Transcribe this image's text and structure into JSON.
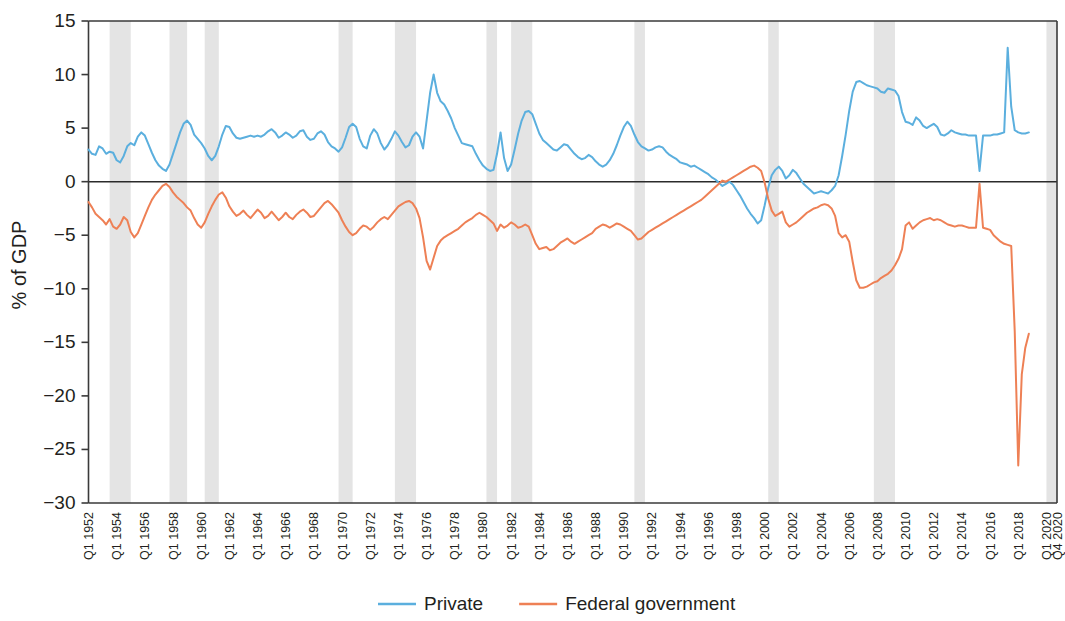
{
  "chart_data": {
    "type": "line",
    "title": "",
    "xlabel": "",
    "ylabel": "% of GDP",
    "ylim": [
      -30,
      15
    ],
    "ytick_values": [
      15,
      10,
      5,
      0,
      -5,
      -10,
      -15,
      -20,
      -25,
      -30
    ],
    "ytick_labels": [
      "15",
      "10",
      "5",
      "0",
      "−5",
      "−10",
      "−15",
      "−20",
      "−25",
      "−30"
    ],
    "grid": false,
    "zero_line": true,
    "legend_position": "bottom-center",
    "x_start_label": "Q1 1952",
    "x_end_label": "Q4 2020",
    "xtick_labels": [
      "Q1 1952",
      "Q1 1954",
      "Q1 1956",
      "Q1 1958",
      "Q1 1960",
      "Q1 1962",
      "Q1 1964",
      "Q1 1966",
      "Q1 1968",
      "Q1 1970",
      "Q1 1972",
      "Q1 1974",
      "Q1 1976",
      "Q1 1978",
      "Q1 1980",
      "Q1 1982",
      "Q1 1984",
      "Q1 1986",
      "Q1 1988",
      "Q1 1990",
      "Q1 1992",
      "Q1 1994",
      "Q1 1996",
      "Q1 1998",
      "Q1 2000",
      "Q1 2002",
      "Q1 2004",
      "Q1 2006",
      "Q1 2008",
      "Q1 2010",
      "Q1 2012",
      "Q1 2014",
      "Q1 2016",
      "Q1 2018",
      "Q1 2020",
      "Q4 2020"
    ],
    "xtick_quarter_index": [
      0,
      8,
      16,
      24,
      32,
      40,
      48,
      56,
      64,
      72,
      80,
      88,
      96,
      104,
      112,
      120,
      128,
      136,
      144,
      152,
      160,
      168,
      176,
      184,
      192,
      200,
      208,
      216,
      224,
      232,
      240,
      248,
      256,
      264,
      272,
      275
    ],
    "n_quarters": 276,
    "colors": {
      "private": "#5BAFDE",
      "federal": "#EE8055",
      "recession_band": "#d9d9d9",
      "axis": "#3a3a3a"
    },
    "series": [
      {
        "name": "Private",
        "color": "#5BAFDE",
        "values": [
          3.0,
          2.6,
          2.5,
          3.3,
          3.1,
          2.6,
          2.8,
          2.7,
          2.0,
          1.8,
          2.4,
          3.3,
          3.6,
          3.4,
          4.2,
          4.6,
          4.3,
          3.5,
          2.7,
          2.0,
          1.5,
          1.2,
          1.0,
          1.6,
          2.6,
          3.6,
          4.6,
          5.4,
          5.7,
          5.3,
          4.4,
          4.0,
          3.6,
          3.1,
          2.4,
          2.0,
          2.4,
          3.3,
          4.4,
          5.2,
          5.1,
          4.5,
          4.1,
          4.0,
          4.1,
          4.2,
          4.3,
          4.2,
          4.3,
          4.2,
          4.4,
          4.7,
          4.9,
          4.6,
          4.1,
          4.3,
          4.6,
          4.4,
          4.1,
          4.3,
          4.7,
          4.8,
          4.2,
          3.9,
          4.0,
          4.5,
          4.7,
          4.4,
          3.7,
          3.3,
          3.1,
          2.8,
          3.2,
          4.1,
          5.1,
          5.4,
          5.1,
          4.0,
          3.3,
          3.1,
          4.3,
          4.9,
          4.5,
          3.6,
          3.0,
          3.4,
          4.0,
          4.7,
          4.3,
          3.7,
          3.2,
          3.4,
          4.2,
          4.6,
          4.2,
          3.1,
          5.7,
          8.3,
          10.0,
          8.3,
          7.5,
          7.2,
          6.6,
          5.9,
          5.0,
          4.3,
          3.6,
          3.5,
          3.4,
          3.3,
          2.6,
          2.0,
          1.5,
          1.2,
          1.0,
          1.1,
          2.6,
          4.6,
          2.2,
          1.0,
          1.6,
          3.0,
          4.5,
          5.7,
          6.5,
          6.6,
          6.3,
          5.4,
          4.5,
          3.9,
          3.6,
          3.3,
          3.0,
          2.9,
          3.2,
          3.5,
          3.4,
          3.0,
          2.6,
          2.3,
          2.1,
          2.2,
          2.5,
          2.3,
          1.9,
          1.6,
          1.4,
          1.6,
          2.0,
          2.6,
          3.4,
          4.3,
          5.1,
          5.6,
          5.2,
          4.4,
          3.7,
          3.3,
          3.1,
          2.9,
          3.0,
          3.2,
          3.3,
          3.2,
          2.8,
          2.5,
          2.3,
          2.1,
          1.8,
          1.7,
          1.6,
          1.4,
          1.5,
          1.3,
          1.1,
          0.9,
          0.7,
          0.4,
          0.2,
          -0.1,
          -0.4,
          -0.2,
          0.0,
          -0.3,
          -0.8,
          -1.3,
          -1.9,
          -2.5,
          -3.0,
          -3.4,
          -3.9,
          -3.6,
          -2.2,
          -0.6,
          0.6,
          1.1,
          1.4,
          1.0,
          0.3,
          0.6,
          1.1,
          0.8,
          0.3,
          -0.2,
          -0.5,
          -0.8,
          -1.1,
          -1.0,
          -0.9,
          -1.0,
          -1.1,
          -0.8,
          -0.4,
          0.6,
          2.4,
          4.4,
          6.6,
          8.4,
          9.3,
          9.4,
          9.2,
          9.0,
          8.9,
          8.8,
          8.7,
          8.4,
          8.3,
          8.7,
          8.6,
          8.5,
          8.0,
          6.5,
          5.6,
          5.5,
          5.3,
          6.0,
          5.7,
          5.2,
          5.0,
          5.2,
          5.4,
          5.1,
          4.4,
          4.3,
          4.5,
          4.8,
          4.6,
          4.5,
          4.4,
          4.4,
          4.3,
          4.3,
          4.3,
          1.0,
          4.3,
          4.3,
          4.3,
          4.4,
          4.4,
          4.5,
          4.6,
          12.5,
          7.0,
          4.8,
          4.6,
          4.5,
          4.5,
          4.6
        ]
      },
      {
        "name": "Federal government",
        "color": "#EE8055",
        "values": [
          -1.9,
          -2.4,
          -3.0,
          -3.3,
          -3.6,
          -4.0,
          -3.5,
          -4.2,
          -4.4,
          -4.0,
          -3.3,
          -3.6,
          -4.7,
          -5.2,
          -4.8,
          -4.0,
          -3.2,
          -2.4,
          -1.7,
          -1.2,
          -0.8,
          -0.4,
          -0.2,
          -0.5,
          -1.0,
          -1.4,
          -1.7,
          -2.0,
          -2.4,
          -2.7,
          -3.4,
          -4.0,
          -4.3,
          -3.8,
          -3.0,
          -2.3,
          -1.7,
          -1.2,
          -1.0,
          -1.5,
          -2.3,
          -2.8,
          -3.2,
          -3.0,
          -2.7,
          -3.1,
          -3.4,
          -3.0,
          -2.6,
          -2.9,
          -3.4,
          -3.2,
          -2.8,
          -3.2,
          -3.6,
          -3.3,
          -2.9,
          -3.3,
          -3.5,
          -3.1,
          -2.8,
          -2.6,
          -2.9,
          -3.3,
          -3.2,
          -2.8,
          -2.4,
          -2.0,
          -1.8,
          -2.1,
          -2.5,
          -2.9,
          -3.6,
          -4.2,
          -4.7,
          -5.0,
          -4.8,
          -4.4,
          -4.1,
          -4.2,
          -4.5,
          -4.2,
          -3.8,
          -3.5,
          -3.3,
          -3.5,
          -3.1,
          -2.7,
          -2.3,
          -2.1,
          -1.9,
          -1.8,
          -2.0,
          -2.5,
          -3.4,
          -5.2,
          -7.4,
          -8.2,
          -7.1,
          -6.0,
          -5.5,
          -5.2,
          -5.0,
          -4.8,
          -4.6,
          -4.4,
          -4.1,
          -3.8,
          -3.6,
          -3.4,
          -3.1,
          -2.9,
          -3.1,
          -3.3,
          -3.6,
          -3.9,
          -4.6,
          -4.0,
          -4.3,
          -4.1,
          -3.8,
          -4.0,
          -4.3,
          -4.2,
          -4.0,
          -4.2,
          -5.0,
          -5.8,
          -6.3,
          -6.2,
          -6.1,
          -6.4,
          -6.3,
          -6.0,
          -5.7,
          -5.5,
          -5.3,
          -5.6,
          -5.8,
          -5.6,
          -5.4,
          -5.2,
          -5.0,
          -4.8,
          -4.4,
          -4.2,
          -4.0,
          -4.1,
          -4.3,
          -4.1,
          -3.9,
          -4.0,
          -4.2,
          -4.4,
          -4.6,
          -5.0,
          -5.4,
          -5.3,
          -5.0,
          -4.7,
          -4.5,
          -4.3,
          -4.1,
          -3.9,
          -3.7,
          -3.5,
          -3.3,
          -3.1,
          -2.9,
          -2.7,
          -2.5,
          -2.3,
          -2.1,
          -1.9,
          -1.7,
          -1.4,
          -1.1,
          -0.8,
          -0.5,
          -0.2,
          0.1,
          0.0,
          0.2,
          0.4,
          0.6,
          0.8,
          1.0,
          1.2,
          1.4,
          1.5,
          1.3,
          1.0,
          -0.1,
          -1.6,
          -2.7,
          -3.2,
          -3.0,
          -2.8,
          -3.8,
          -4.2,
          -4.0,
          -3.8,
          -3.5,
          -3.2,
          -2.9,
          -2.7,
          -2.5,
          -2.4,
          -2.2,
          -2.1,
          -2.2,
          -2.5,
          -3.2,
          -4.8,
          -5.2,
          -5.0,
          -5.6,
          -7.5,
          -9.2,
          -9.9,
          -9.9,
          -9.8,
          -9.6,
          -9.4,
          -9.3,
          -9.0,
          -8.8,
          -8.6,
          -8.3,
          -7.8,
          -7.2,
          -6.3,
          -4.1,
          -3.8,
          -4.4,
          -4.1,
          -3.8,
          -3.6,
          -3.5,
          -3.4,
          -3.6,
          -3.5,
          -3.6,
          -3.8,
          -4.0,
          -4.1,
          -4.2,
          -4.1,
          -4.1,
          -4.2,
          -4.3,
          -4.3,
          -4.3,
          -0.2,
          -4.3,
          -4.4,
          -4.5,
          -5.0,
          -5.3,
          -5.6,
          -5.8,
          -5.9,
          -6.0,
          -14.0,
          -26.5,
          -18.0,
          -15.5,
          -14.2
        ]
      }
    ],
    "recessions": [
      {
        "label": "1953-1954",
        "start_q": 6,
        "end_q": 12
      },
      {
        "label": "1957-1958",
        "start_q": 23,
        "end_q": 28
      },
      {
        "label": "1960-1961",
        "start_q": 33,
        "end_q": 37
      },
      {
        "label": "1969-1970",
        "start_q": 71,
        "end_q": 75
      },
      {
        "label": "1973-1975",
        "start_q": 87,
        "end_q": 93
      },
      {
        "label": "1980",
        "start_q": 113,
        "end_q": 116
      },
      {
        "label": "1981-1982",
        "start_q": 120,
        "end_q": 126
      },
      {
        "label": "1990-1991",
        "start_q": 155,
        "end_q": 158
      },
      {
        "label": "2001",
        "start_q": 193,
        "end_q": 196
      },
      {
        "label": "2007-2009",
        "start_q": 223,
        "end_q": 229
      },
      {
        "label": "2020",
        "start_q": 272,
        "end_q": 275
      }
    ]
  },
  "legend": {
    "items": [
      {
        "label": "Private",
        "color": "#5BAFDE"
      },
      {
        "label": "Federal government",
        "color": "#EE8055"
      }
    ]
  },
  "axis": {
    "y_title": "% of GDP"
  }
}
